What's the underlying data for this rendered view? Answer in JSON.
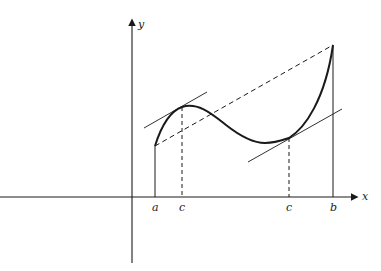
{
  "diagram": {
    "type": "mean-value-theorem",
    "axes": {
      "x_label": "x",
      "y_label": "y"
    },
    "tick_labels": {
      "a": "a",
      "c1": "c",
      "c2": "c",
      "b": "b"
    },
    "elements": [
      {
        "name": "curve",
        "style": "solid-thick",
        "description": "graph of f on [a, b]"
      },
      {
        "name": "secant-line",
        "style": "dashed",
        "description": "chord from (a, f(a)) to (b, f(b))"
      },
      {
        "name": "tangent-line-1",
        "style": "solid-thin",
        "description": "tangent at first c, parallel to secant"
      },
      {
        "name": "tangent-line-2",
        "style": "solid-thin",
        "description": "tangent at second c, parallel to secant"
      },
      {
        "name": "vertical-a",
        "style": "solid",
        "description": "vertical segment at x = a"
      },
      {
        "name": "vertical-b",
        "style": "solid",
        "description": "vertical segment at x = b"
      },
      {
        "name": "drop-c1",
        "style": "dashed",
        "description": "vertical dashed line at first c"
      },
      {
        "name": "drop-c2",
        "style": "dashed",
        "description": "vertical dashed line at second c"
      }
    ],
    "colors": {
      "ink": "#1a1a1a",
      "background": "#ffffff"
    }
  }
}
